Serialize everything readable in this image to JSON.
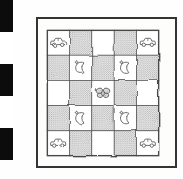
{
  "image": {
    "description": "Hand-drawn pen-and-ink illustration of a 5x5 checkerboard quilt with car motifs in the four corners, crescent-moon-with-star motifs in the inner squares, and a stippled butterfly in the center square, framed by a thin rectangle, with a black-and-white photographic scale strip along the left edge",
    "colors": {
      "paper": "#fdfdfc",
      "ink": "#4a4a4a",
      "shade_bg": "#e9e9e9",
      "shade_dot": "#a0a0a0",
      "frame_line": "#343434",
      "scale_black": "#0c0c0c",
      "scale_white": "#ffffff"
    }
  },
  "scale_bar": {
    "segments": [
      "black",
      "white",
      "black",
      "white",
      "black"
    ]
  },
  "quilt": {
    "rows": 5,
    "cols": 5,
    "grid": [
      [
        "car",
        "shade",
        "plain",
        "shade",
        "car"
      ],
      [
        "shade",
        "moon",
        "shade",
        "moon",
        "shade"
      ],
      [
        "plain",
        "shade",
        "butterfly",
        "shade",
        "plain"
      ],
      [
        "shade",
        "moon",
        "shade",
        "moon",
        "shade"
      ],
      [
        "car",
        "shade",
        "plain",
        "shade",
        "car"
      ]
    ],
    "motifs": {
      "car": "toy car seen from the side",
      "moon": "crescent moon with small four-pointed star",
      "butterfly": "butterfly with four stippled wings",
      "shade": "stippled gray square",
      "plain": "plain white square"
    }
  }
}
